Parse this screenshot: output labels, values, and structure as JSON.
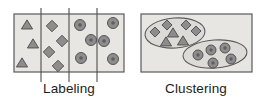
{
  "figure": {
    "background_color": "#ffffff",
    "panel_fill": "#e8e6e3",
    "panel_stroke": "#5a5a5a",
    "shape_fill": "#8d8d8d",
    "shape_stroke": "#4a4a4a",
    "divider_color": "#4d4d4d",
    "caption_color": "#1c1c1c"
  },
  "panels": [
    {
      "id": "labeling",
      "caption": "Labeling",
      "box": {
        "x": 14,
        "y": 14,
        "width": 110,
        "height": 58
      },
      "caption_position": {
        "x": 69,
        "y": 93
      },
      "dividers": [
        {
          "x": 41,
          "y1": 8,
          "y2": 82
        },
        {
          "x": 69,
          "y1": 8,
          "y2": 82
        },
        {
          "x": 97,
          "y1": 8,
          "y2": 82
        }
      ],
      "groups": [
        {
          "name": "triangles-column",
          "shape": "triangle",
          "count": 3,
          "items": [
            {
              "cx": 27,
              "cy": 25,
              "size": 9
            },
            {
              "cx": 33,
              "cy": 44,
              "size": 9
            },
            {
              "cx": 22,
              "cy": 63,
              "size": 9
            }
          ]
        },
        {
          "name": "diamonds-column",
          "shape": "diamond",
          "count": 4,
          "items": [
            {
              "cx": 52,
              "cy": 26,
              "size": 8
            },
            {
              "cx": 62,
              "cy": 41,
              "size": 8
            },
            {
              "cx": 49,
              "cy": 52,
              "size": 8
            },
            {
              "cx": 58,
              "cy": 66,
              "size": 8
            }
          ]
        },
        {
          "name": "circles-column-a",
          "shape": "ring",
          "count": 3,
          "items": [
            {
              "cx": 80,
              "cy": 25,
              "r": 5.5
            },
            {
              "cx": 91,
              "cy": 40,
              "r": 5.5
            },
            {
              "cx": 81,
              "cy": 58,
              "r": 5.5
            }
          ]
        },
        {
          "name": "circles-column-b",
          "shape": "ring",
          "count": 3,
          "items": [
            {
              "cx": 113,
              "cy": 23,
              "r": 5.5
            },
            {
              "cx": 104,
              "cy": 41,
              "r": 5.5
            },
            {
              "cx": 113,
              "cy": 59,
              "r": 5.5
            }
          ]
        }
      ]
    },
    {
      "id": "clustering",
      "caption": "Clustering",
      "box": {
        "x": 141,
        "y": 14,
        "width": 111,
        "height": 58
      },
      "caption_position": {
        "x": 196,
        "y": 93
      },
      "clusters": [
        {
          "name": "cluster-diamonds-triangles",
          "ellipse": {
            "cx": 175,
            "cy": 33,
            "rx": 30,
            "ry": 15,
            "rotate": -4
          },
          "members": [
            {
              "shape": "diamond",
              "cx": 155,
              "cy": 32,
              "size": 7
            },
            {
              "shape": "diamond",
              "cx": 167,
              "cy": 25,
              "size": 7
            },
            {
              "shape": "diamond",
              "cx": 186,
              "cy": 25,
              "size": 7
            },
            {
              "shape": "diamond",
              "cx": 196,
              "cy": 31,
              "size": 7
            },
            {
              "shape": "triangle",
              "cx": 173,
              "cy": 33,
              "size": 9
            },
            {
              "shape": "triangle",
              "cx": 166,
              "cy": 42,
              "size": 9
            },
            {
              "shape": "triangle",
              "cx": 183,
              "cy": 41,
              "size": 9
            }
          ]
        },
        {
          "name": "cluster-circles",
          "ellipse": {
            "cx": 215,
            "cy": 54,
            "rx": 32,
            "ry": 14,
            "rotate": -4
          },
          "members": [
            {
              "shape": "ring",
              "cx": 198,
              "cy": 55,
              "r": 5
            },
            {
              "shape": "ring",
              "cx": 211,
              "cy": 50,
              "r": 5
            },
            {
              "shape": "ring",
              "cx": 225,
              "cy": 48,
              "r": 5
            },
            {
              "shape": "ring",
              "cx": 213,
              "cy": 63,
              "r": 5
            },
            {
              "shape": "ring",
              "cx": 231,
              "cy": 59,
              "r": 5
            }
          ]
        }
      ]
    }
  ]
}
